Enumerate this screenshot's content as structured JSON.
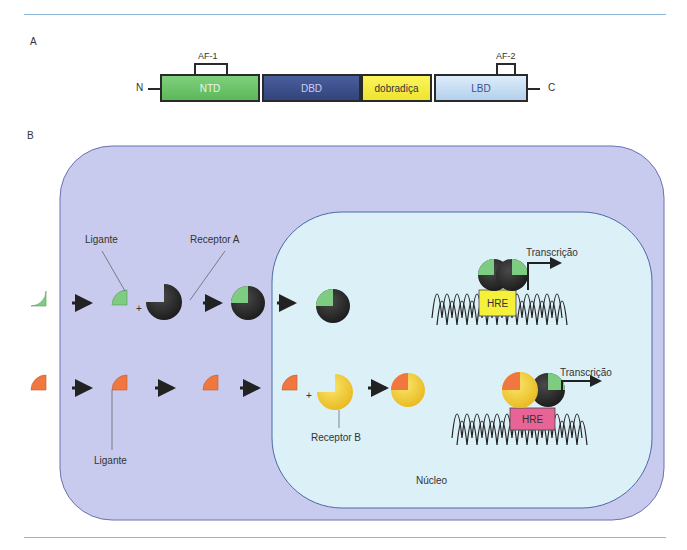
{
  "panel_a": {
    "label": "A",
    "n_terminus": "N",
    "c_terminus": "C",
    "domains": [
      {
        "name": "NTD",
        "color": "#6cc46a",
        "text_color": "#e8f5e8"
      },
      {
        "name": "DBD",
        "color": "#3c4f8c",
        "text_color": "#c8d0ee"
      },
      {
        "name": "dobradiça",
        "color": "#f5f03c",
        "text_color": "#333333"
      },
      {
        "name": "LBD",
        "color": "#c4dcf2",
        "text_color": "#3c4f8c"
      }
    ],
    "af1": "AF-1",
    "af2": "AF-2"
  },
  "panel_b": {
    "label": "B",
    "cell_color": "#c9cbee",
    "nucleus_color": "#dcf0f8",
    "nucleus_label": "Núcleo",
    "top_row": {
      "ligand_label": "Ligante",
      "receptor_label": "Receptor A",
      "ligand_color": "#7ecb82",
      "receptor_color": "#2a2a2a",
      "hre_label": "HRE",
      "hre_color": "#f5f03c",
      "transcription_label": "Transcrição"
    },
    "bottom_row": {
      "ligand_label": "Ligante",
      "receptor_label": "Receptor B",
      "ligand_color": "#f07840",
      "receptor_color": "#f5cc3c",
      "hre_label": "HRE",
      "hre_color": "#e86496",
      "transcription_label": "Transcrição"
    },
    "plus": "+"
  }
}
